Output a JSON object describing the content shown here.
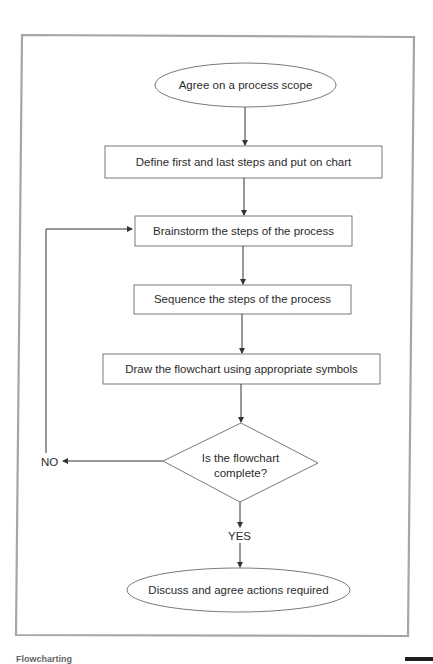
{
  "diagram": {
    "type": "flowchart",
    "frame_color": "#a6a6a6",
    "line_color": "#333333",
    "nodes": [
      {
        "id": "start",
        "shape": "ellipse",
        "label": "Agree on a process scope"
      },
      {
        "id": "step1",
        "shape": "rectangle",
        "label": "Define first and last steps and put on chart"
      },
      {
        "id": "step2",
        "shape": "rectangle",
        "label": "Brainstorm the steps of the process"
      },
      {
        "id": "step3",
        "shape": "rectangle",
        "label": "Sequence the steps of the process"
      },
      {
        "id": "step4",
        "shape": "rectangle",
        "label": "Draw the flowchart using appropriate symbols"
      },
      {
        "id": "decision",
        "shape": "diamond",
        "label_line1": "Is the flowchart",
        "label_line2": "complete?"
      },
      {
        "id": "end",
        "shape": "ellipse",
        "label": "Discuss and agree actions required"
      }
    ],
    "edges": [
      {
        "from": "start",
        "to": "step1"
      },
      {
        "from": "step1",
        "to": "step2"
      },
      {
        "from": "step2",
        "to": "step3"
      },
      {
        "from": "step3",
        "to": "step4"
      },
      {
        "from": "step4",
        "to": "decision"
      },
      {
        "from": "decision",
        "to": "end",
        "label": "YES"
      },
      {
        "from": "decision",
        "to": "step2",
        "label": "NO"
      }
    ],
    "labels": {
      "no": "NO",
      "yes": "YES"
    }
  },
  "footer": {
    "caption": "Flowcharting"
  }
}
